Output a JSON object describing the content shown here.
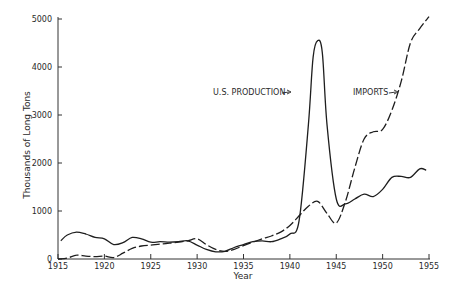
{
  "chart_data": {
    "type": "line",
    "title": "",
    "xlabel": "Year",
    "ylabel": "Thousands of Long Tons",
    "xlim": [
      1915,
      1955
    ],
    "ylim": [
      0,
      5000
    ],
    "x_ticks": [
      "1915",
      "1920",
      "1925",
      "1930",
      "1935",
      "1940",
      "1945",
      "1950",
      "1955"
    ],
    "y_ticks": [
      "0",
      "1000",
      "2000",
      "3000",
      "4000",
      "5000"
    ],
    "grid": false,
    "legend": "inline annotations",
    "series": [
      {
        "name": "U.S. PRODUCTION",
        "style": "solid",
        "x": [
          1915.3,
          1916,
          1917,
          1918,
          1919,
          1920,
          1921,
          1922,
          1923,
          1924,
          1925,
          1926,
          1927,
          1928,
          1929,
          1930,
          1931,
          1932,
          1933,
          1934,
          1935,
          1936,
          1937,
          1938,
          1939,
          1940,
          1941,
          1942,
          1942.5,
          1943,
          1943.5,
          1944,
          1945,
          1946,
          1947,
          1948,
          1949,
          1950,
          1951,
          1952,
          1953,
          1954,
          1954.7
        ],
        "values": [
          380,
          500,
          560,
          520,
          450,
          420,
          300,
          340,
          450,
          420,
          350,
          360,
          350,
          360,
          380,
          290,
          200,
          150,
          160,
          240,
          300,
          360,
          380,
          360,
          420,
          520,
          800,
          2800,
          4200,
          4550,
          4300,
          2800,
          1250,
          1150,
          1250,
          1350,
          1300,
          1450,
          1700,
          1720,
          1700,
          1880,
          1850
        ]
      },
      {
        "name": "IMPORTS",
        "style": "dashed",
        "x": [
          1915,
          1916,
          1917,
          1918,
          1919,
          1920,
          1921,
          1922,
          1923,
          1924,
          1925,
          1926,
          1927,
          1928,
          1929,
          1930,
          1931,
          1932,
          1933,
          1934,
          1935,
          1936,
          1937,
          1938,
          1939,
          1940,
          1941,
          1942,
          1943,
          1944,
          1945,
          1946,
          1947,
          1948,
          1949,
          1950,
          1951,
          1952,
          1953,
          1954,
          1955
        ],
        "values": [
          0,
          20,
          80,
          60,
          50,
          60,
          30,
          120,
          220,
          270,
          290,
          310,
          330,
          350,
          380,
          420,
          300,
          200,
          160,
          200,
          280,
          350,
          420,
          480,
          560,
          700,
          900,
          1100,
          1200,
          950,
          750,
          1200,
          1900,
          2500,
          2650,
          2700,
          3100,
          3700,
          4500,
          4800,
          5050
        ]
      }
    ],
    "annotations": [
      {
        "text": "U.S. PRODUCTION",
        "points_to": "solid line peak near 1943"
      },
      {
        "text": "IMPORTS",
        "points_to": "dashed line near 1951"
      }
    ]
  },
  "labels": {
    "ylabel": "Thousands of Long Tons",
    "xlabel": "Year",
    "production": "U.S. PRODUCTION",
    "imports": "IMPORTS"
  }
}
